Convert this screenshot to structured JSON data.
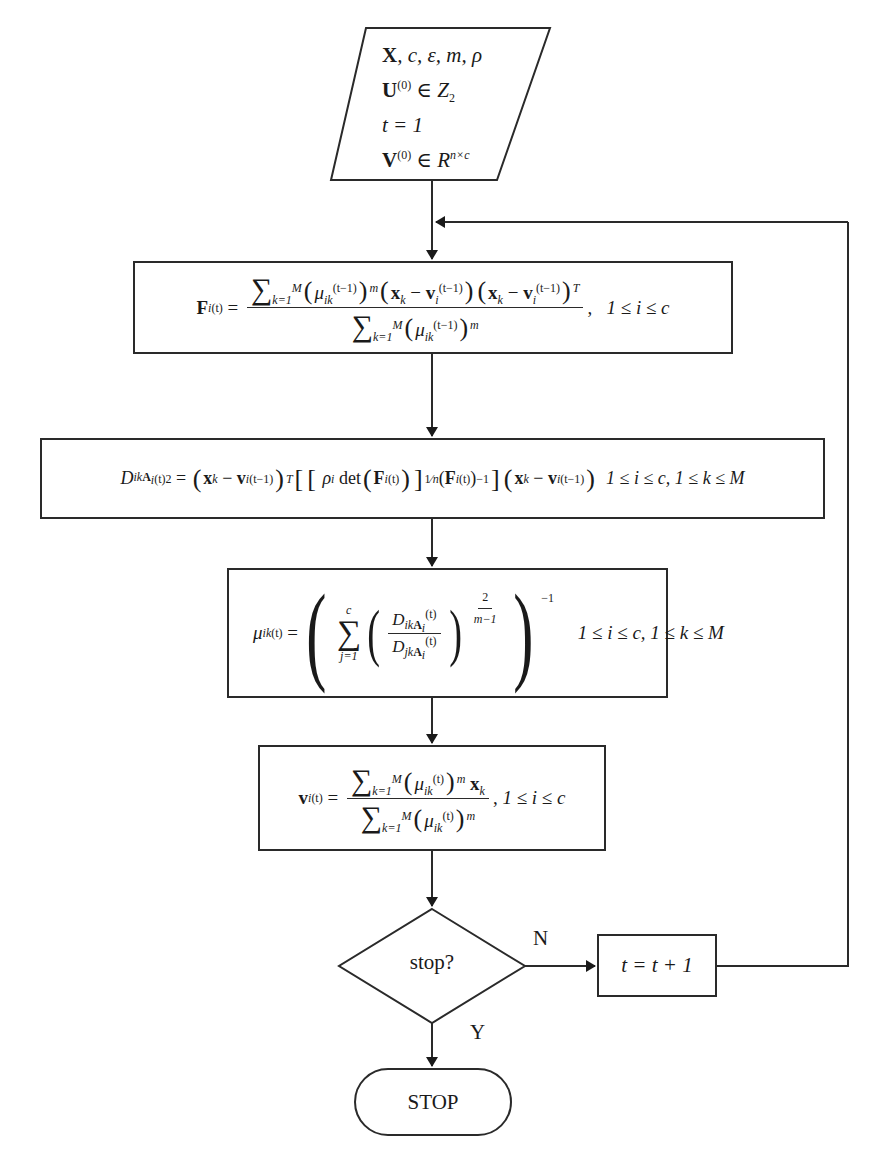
{
  "input": {
    "line1": "X, c, ε, m, ρ",
    "line2_lhs": "U",
    "line2_sup": "(0)",
    "line2_rhs": "∈ Z",
    "line2_sub": "2",
    "line3": "t = 1",
    "line4_lhs": "V",
    "line4_sup": "(0)",
    "line4_rhs": "∈ R",
    "line4_sup2": "n×c"
  },
  "step_f": {
    "lhs": "F",
    "lhs_sub": "i",
    "lhs_sup": "(t)",
    "numerator": "Σ_{k=1}^{M} (μ_ik^(t−1))^m (x_k − v_i^(t−1))(x_k − v_i^(t−1))^T",
    "denominator": "Σ_{k=1}^{M} (μ_ik^(t−1))^m",
    "condition": "1 ≤ i ≤ c"
  },
  "step_d": {
    "lhs": "D",
    "lhs_sub": "ikA_i",
    "lhs_sup": "(t)2",
    "expression": "(x_k − v_i^(t−1))^T [[ρ_i det(F_i^(t))]^(1/n) (F_i^(t))^−1] (x_k − v_i^(t−1))",
    "condition": "1 ≤ i ≤ c, 1 ≤ k ≤ M"
  },
  "step_mu": {
    "lhs": "μ",
    "lhs_sub": "ik",
    "lhs_sup": "(t)",
    "expression": "( Σ_{j=1}^{c} ( D_ikA_i^(t) / D_jkA_i^(t) )^(2/(m−1)) )^−1",
    "exponent_num": "2",
    "exponent_den": "m−1",
    "outer_exp": "−1",
    "sum_upper": "c",
    "sum_lower": "j=1",
    "condition": "1 ≤ i ≤ c, 1 ≤ k ≤ M"
  },
  "step_v": {
    "lhs": "v",
    "lhs_sub": "i",
    "lhs_sup": "(t)",
    "numerator": "Σ_{k=1}^{M} (μ_ik^(t))^m x_k",
    "denominator": "Σ_{k=1}^{M} (μ_ik^(t))^m",
    "condition": "1 ≤ i ≤ c"
  },
  "decision": {
    "label": "stop?",
    "no_label": "N",
    "yes_label": "Y"
  },
  "increment": {
    "label": "t = t + 1"
  },
  "terminal": {
    "label": "STOP"
  },
  "colors": {
    "line": "#2a2a2a",
    "background": "#ffffff",
    "text": "#1a1a1a"
  }
}
